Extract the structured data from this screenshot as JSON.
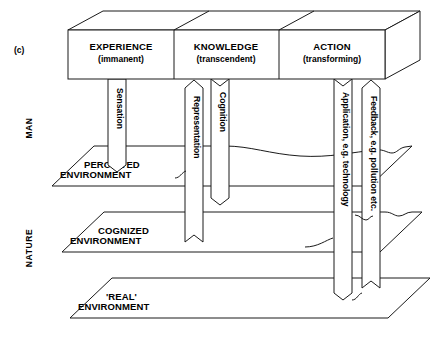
{
  "figure": {
    "label": "(c)",
    "domain_rows": [
      {
        "name": "man",
        "label": "MAN"
      },
      {
        "name": "nature",
        "label": "NATURE"
      }
    ]
  },
  "top_box": {
    "panels": [
      {
        "name": "experience",
        "title": "EXPERIENCE",
        "subtitle": "(immanent)"
      },
      {
        "name": "knowledge",
        "title": "KNOWLEDGE",
        "subtitle": "(transcendent)"
      },
      {
        "name": "action",
        "title": "ACTION",
        "subtitle": "(transforming)"
      }
    ]
  },
  "planes": [
    {
      "name": "perceived-environment",
      "line1": "PERCEIVED",
      "line2": "ENVIRONMENT"
    },
    {
      "name": "cognized-environment",
      "line1": "COGNIZED",
      "line2": "ENVIRONMENT"
    },
    {
      "name": "real-environment",
      "line1": "'REAL'",
      "line2": "ENVIRONMENT"
    }
  ],
  "arrows": [
    {
      "name": "sensation",
      "label": "Sensation",
      "direction": "down"
    },
    {
      "name": "representation",
      "label": "Representation",
      "direction": "up"
    },
    {
      "name": "cognition",
      "label": "Cognition",
      "direction": "down"
    },
    {
      "name": "application",
      "label": "Application, e.g. technology",
      "direction": "down"
    },
    {
      "name": "feedback",
      "label": "Feedback, e.g. pollution etc.",
      "direction": "up"
    }
  ],
  "colors": {
    "ink": "#1a1a1a",
    "paper": "#ffffff"
  }
}
